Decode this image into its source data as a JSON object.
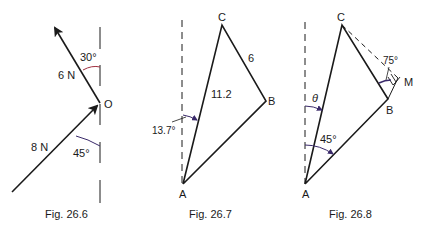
{
  "figures": [
    {
      "caption": "Fig. 26.6",
      "point_label": "O",
      "force_up": {
        "label": "6 N",
        "angle": "30°"
      },
      "force_in": {
        "label": "8 N",
        "angle": "45°"
      }
    },
    {
      "caption": "Fig. 26.7",
      "vertices": {
        "A": "A",
        "B": "B",
        "C": "C"
      },
      "side_AC": "11.2",
      "side_BC": "6",
      "angle": "13.7°"
    },
    {
      "caption": "Fig. 26.8",
      "vertices": {
        "A": "A",
        "B": "B",
        "C": "C",
        "M": "M"
      },
      "angle_theta": "θ",
      "angle_A": "45°",
      "angle_M": "75°"
    }
  ],
  "colors": {
    "line": "#1a1a1a",
    "angle_arc": "#3a2a6a",
    "angle_arc_red": "#a03040",
    "background": "#ffffff"
  }
}
